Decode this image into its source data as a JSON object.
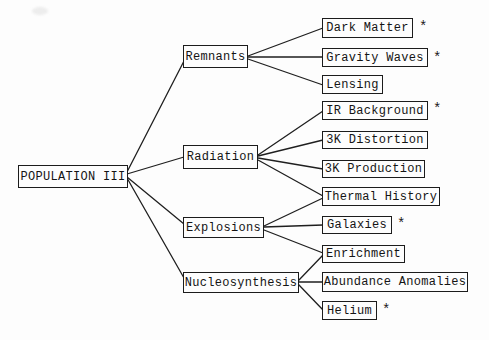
{
  "diagram": {
    "root": {
      "label": "POPULATION III"
    },
    "branches": [
      {
        "label": "Remnants"
      },
      {
        "label": "Radiation"
      },
      {
        "label": "Explosions"
      },
      {
        "label": "Nucleosynthesis"
      }
    ],
    "leaves": [
      {
        "label": "Dark Matter",
        "star": "*"
      },
      {
        "label": "Gravity Waves",
        "star": "*"
      },
      {
        "label": "Lensing",
        "star": ""
      },
      {
        "label": "IR Background",
        "star": "*"
      },
      {
        "label": "3K Distortion",
        "star": ""
      },
      {
        "label": "3K Production",
        "star": ""
      },
      {
        "label": "Thermal History",
        "star": ""
      },
      {
        "label": "Galaxies",
        "star": "*"
      },
      {
        "label": "Enrichment",
        "star": ""
      },
      {
        "label": "Abundance Anomalies",
        "star": ""
      },
      {
        "label": "Helium",
        "star": "*"
      }
    ],
    "edges": [
      {
        "from": "POPULATION III",
        "to": "Remnants"
      },
      {
        "from": "POPULATION III",
        "to": "Radiation"
      },
      {
        "from": "POPULATION III",
        "to": "Explosions"
      },
      {
        "from": "POPULATION III",
        "to": "Nucleosynthesis"
      },
      {
        "from": "Remnants",
        "to": "Dark Matter"
      },
      {
        "from": "Remnants",
        "to": "Gravity Waves"
      },
      {
        "from": "Remnants",
        "to": "Lensing"
      },
      {
        "from": "Radiation",
        "to": "IR Background"
      },
      {
        "from": "Radiation",
        "to": "3K Distortion"
      },
      {
        "from": "Radiation",
        "to": "3K Production"
      },
      {
        "from": "Radiation",
        "to": "Thermal History"
      },
      {
        "from": "Explosions",
        "to": "Thermal History"
      },
      {
        "from": "Explosions",
        "to": "Galaxies"
      },
      {
        "from": "Explosions",
        "to": "Enrichment"
      },
      {
        "from": "Nucleosynthesis",
        "to": "Enrichment"
      },
      {
        "from": "Nucleosynthesis",
        "to": "Abundance Anomalies"
      },
      {
        "from": "Nucleosynthesis",
        "to": "Helium"
      }
    ],
    "colors": {
      "ink": "#1c1c1c",
      "paper": "#fdfdfd"
    }
  }
}
